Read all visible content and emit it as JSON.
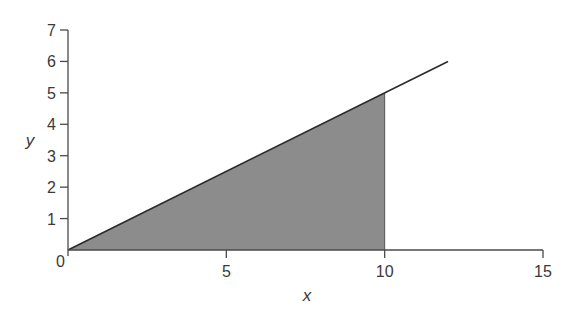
{
  "chart_data": {
    "type": "area",
    "title": "",
    "xlabel": "x",
    "ylabel": "y",
    "xlim": [
      0,
      15
    ],
    "ylim": [
      0,
      7
    ],
    "x_ticks": [
      0,
      5,
      10,
      15
    ],
    "y_ticks": [
      0,
      1,
      2,
      3,
      4,
      5,
      6,
      7
    ],
    "x_tick_labels": [
      "0",
      "5",
      "10",
      "15"
    ],
    "y_tick_labels": [
      "0",
      "1",
      "2",
      "3",
      "4",
      "5",
      "6",
      "7"
    ],
    "grid": false,
    "legend": null,
    "series": [
      {
        "name": "line y = 0.5x",
        "kind": "line",
        "x": [
          0,
          12
        ],
        "y": [
          0,
          6
        ],
        "color": "#2a2a2a"
      },
      {
        "name": "shaded area under line, 0 ≤ x ≤ 10",
        "kind": "area",
        "x": [
          0,
          10
        ],
        "y": [
          0,
          5
        ],
        "color": "#8c8c8c"
      }
    ],
    "annotations": []
  },
  "colors": {
    "axis": "#4a4a4a",
    "line": "#2a2a2a",
    "fill": "#8c8c8c",
    "text": "#3a3a3a"
  }
}
